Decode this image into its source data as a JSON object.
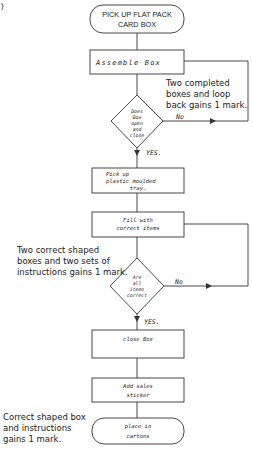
{
  "corner_mark": ")",
  "flowchart": {
    "start": {
      "line1": "PICK UP FLAT PACK",
      "line2": "CARD BOX"
    },
    "assemble": {
      "label": "Assemble Box"
    },
    "decision1": {
      "lines": [
        "Does",
        "Box",
        "open",
        "and",
        "close"
      ],
      "no": "No",
      "yes": "YES."
    },
    "tray": {
      "line1": "Pick up",
      "line2": "plastic moulded",
      "line3": "tray."
    },
    "fill": {
      "line1": "Fill with",
      "line2": "correct items"
    },
    "decision2": {
      "lines": [
        "Are",
        "all",
        "items",
        "correct"
      ],
      "no": "No",
      "yes": "YES."
    },
    "close": {
      "label": "close Box"
    },
    "sticker": {
      "line1": "Add sales",
      "line2": "sticker"
    },
    "end": {
      "line1": "place in",
      "line2": "cartons"
    }
  },
  "notes": {
    "loop": [
      "Two completed",
      "boxes and loop",
      "back gains 1 mark."
    ],
    "shapes": [
      "Two correct shaped",
      "boxes and two sets of",
      "instructions gains 1 mark."
    ],
    "terminator": [
      "Correct shaped box",
      "and instructions",
      "gains 1 mark."
    ]
  }
}
